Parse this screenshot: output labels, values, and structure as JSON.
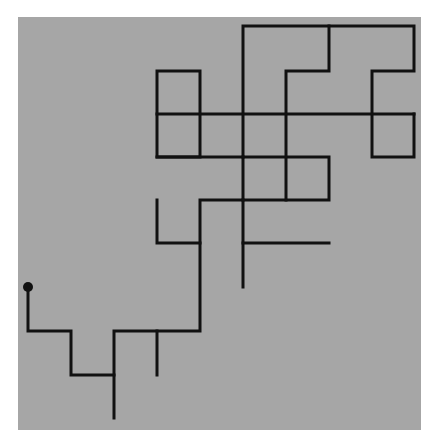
{
  "diagram": {
    "type": "grid-random-walk",
    "background": {
      "x": 18,
      "y": 17,
      "width": 403,
      "height": 413,
      "color": "#a6a6a6"
    },
    "page_color": "#ffffff",
    "line_color": "#111111",
    "line_width": 3,
    "start_marker": {
      "x": 28,
      "y": 287,
      "r": 5,
      "color": "#111111"
    },
    "segments": [
      [
        [
          28,
          287
        ],
        [
          28,
          331
        ],
        [
          71,
          331
        ],
        [
          71,
          375
        ],
        [
          114,
          375
        ]
      ],
      [
        [
          114,
          418
        ],
        [
          114,
          331
        ],
        [
          200,
          331
        ],
        [
          200,
          200
        ],
        [
          243,
          200
        ]
      ],
      [
        [
          157,
          331
        ],
        [
          157,
          375
        ]
      ],
      [
        [
          157,
          200
        ],
        [
          157,
          243
        ],
        [
          200,
          243
        ]
      ],
      [
        [
          243,
          287
        ],
        [
          243,
          26
        ],
        [
          414,
          26
        ],
        [
          414,
          71
        ],
        [
          372,
          71
        ],
        [
          372,
          157
        ],
        [
          414,
          157
        ],
        [
          414,
          114
        ]
      ],
      [
        [
          243,
          243
        ],
        [
          329,
          243
        ]
      ],
      [
        [
          243,
          200
        ],
        [
          329,
          200
        ],
        [
          329,
          157
        ],
        [
          243,
          157
        ]
      ],
      [
        [
          286,
          200
        ],
        [
          286,
          71
        ],
        [
          329,
          71
        ],
        [
          329,
          26
        ]
      ],
      [
        [
          157,
          114
        ],
        [
          414,
          114
        ]
      ],
      [
        [
          157,
          157
        ],
        [
          157,
          71
        ],
        [
          200,
          71
        ],
        [
          200,
          157
        ],
        [
          157,
          157
        ]
      ],
      [
        [
          157,
          157
        ],
        [
          243,
          157
        ]
      ]
    ]
  }
}
